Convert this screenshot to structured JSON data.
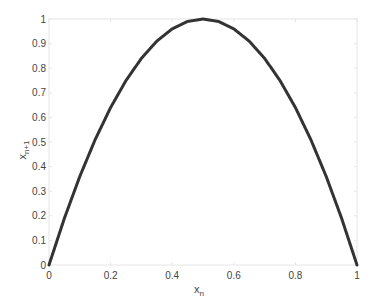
{
  "chart_data": {
    "type": "line",
    "title": "",
    "xlabel": "x_n",
    "xlabel_main": "x",
    "xlabel_sub": "n",
    "ylabel": "x_n+1",
    "ylabel_main": "x",
    "ylabel_sub": "n+1",
    "xlim": [
      0,
      1
    ],
    "ylim": [
      0,
      1
    ],
    "grid": false,
    "legend": null,
    "x_ticks": [
      0,
      0.2,
      0.4,
      0.6,
      0.8,
      1
    ],
    "x_tick_labels": [
      "0",
      "0.2",
      "0.4",
      "0.6",
      "0.8",
      "1"
    ],
    "y_ticks": [
      0,
      0.1,
      0.2,
      0.3,
      0.4,
      0.5,
      0.6,
      0.7,
      0.8,
      0.9,
      1
    ],
    "y_tick_labels": [
      "0",
      "0.1",
      "0.2",
      "0.3",
      "0.4",
      "0.5",
      "0.6",
      "0.7",
      "0.8",
      "0.9",
      "1"
    ],
    "series": [
      {
        "name": "logistic map",
        "color": "#333333",
        "marker": "dot",
        "x": [
          0,
          0.05,
          0.1,
          0.15,
          0.2,
          0.25,
          0.3,
          0.35,
          0.4,
          0.45,
          0.5,
          0.55,
          0.6,
          0.65,
          0.7,
          0.75,
          0.8,
          0.85,
          0.9,
          0.95,
          1
        ],
        "values": [
          0,
          0.19,
          0.36,
          0.51,
          0.64,
          0.75,
          0.84,
          0.91,
          0.96,
          0.99,
          1.0,
          0.99,
          0.96,
          0.91,
          0.84,
          0.75,
          0.64,
          0.51,
          0.36,
          0.19,
          0
        ]
      }
    ]
  },
  "colors": {
    "axis": "#e6e6e6",
    "curve": "#333333",
    "text": "#444444"
  }
}
